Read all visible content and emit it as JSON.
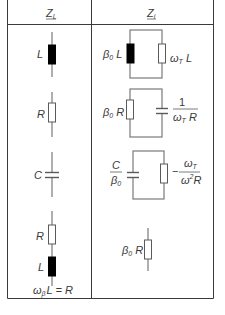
{
  "table": {
    "headers": [
      {
        "main": "Z",
        "sub": "L",
        "underline": true
      },
      {
        "main": "Z",
        "sub": "i",
        "underline": true
      }
    ],
    "rows": [
      {
        "left": {
          "element": "inductor",
          "label": "L"
        },
        "right": {
          "topology": "parallel",
          "branch1": {
            "element": "inductor",
            "label_main": "β",
            "label_sub": "0",
            "label_tail": " L"
          },
          "branch2": {
            "element": "resistor",
            "label_main": "ω",
            "label_sub": "T",
            "label_tail": " L"
          }
        }
      },
      {
        "left": {
          "element": "resistor",
          "label": "R"
        },
        "right": {
          "topology": "parallel",
          "branch1": {
            "element": "resistor",
            "label_main": "β",
            "label_sub": "0",
            "label_tail": " R"
          },
          "branch2": {
            "element": "capacitor",
            "fraction_num": "1",
            "fraction_den_main": "ω",
            "fraction_den_sub": "T",
            "fraction_den_tail": " R"
          }
        }
      },
      {
        "left": {
          "element": "capacitor",
          "label": "C"
        },
        "right": {
          "topology": "parallel",
          "branch1": {
            "element": "capacitor",
            "fraction_num": "C",
            "fraction_den_main": "β",
            "fraction_den_sub": "0"
          },
          "branch2": {
            "element": "resistor",
            "sign": "−",
            "fraction_num_main": "ω",
            "fraction_num_sub": "T",
            "fraction_den_main": "ω",
            "fraction_den_sup": "2",
            "fraction_den_tail": "R"
          }
        }
      },
      {
        "left": {
          "element": "series",
          "top": {
            "element": "resistor",
            "label": "R"
          },
          "bottom": {
            "element": "inductor",
            "label": "L"
          },
          "condition_main": "ω",
          "condition_sub": "β",
          "condition_tail": "L = R"
        },
        "right": {
          "element": "resistor",
          "label_main": "β",
          "label_sub": "0",
          "label_tail": " R"
        }
      }
    ]
  }
}
